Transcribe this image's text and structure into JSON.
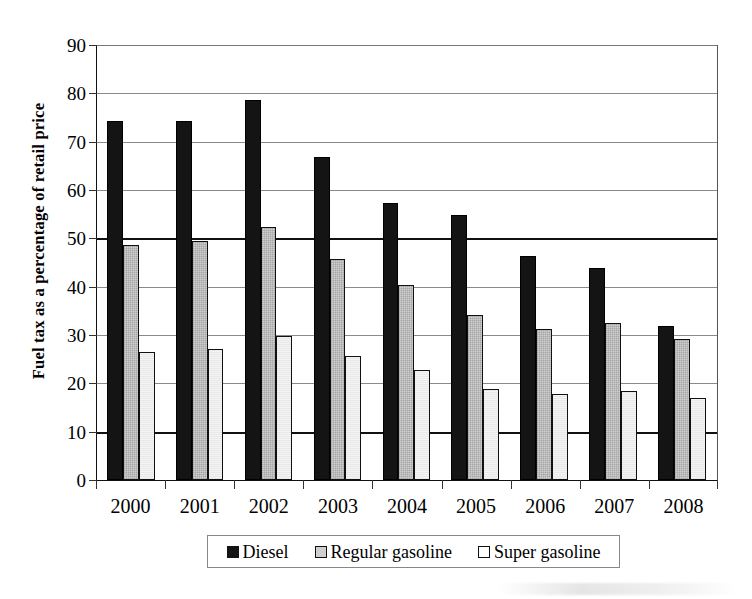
{
  "chart_data": {
    "type": "bar",
    "title": "",
    "xlabel": "",
    "ylabel": "Fuel tax as a percentage of retail price",
    "categories": [
      "2000",
      "2001",
      "2002",
      "2003",
      "2004",
      "2005",
      "2006",
      "2007",
      "2008"
    ],
    "series": [
      {
        "name": "Diesel",
        "color": "#141414",
        "values": [
          74.2,
          74.3,
          78.7,
          66.8,
          57.3,
          54.8,
          46.4,
          43.9,
          31.8
        ]
      },
      {
        "name": "Regular gasoline",
        "color": "#cfcfcf",
        "values": [
          48.7,
          49.4,
          52.4,
          45.7,
          40.4,
          34.2,
          31.3,
          32.5,
          29.2
        ]
      },
      {
        "name": "Super gasoline",
        "color": "#f4f4f4",
        "values": [
          26.4,
          27.2,
          29.8,
          25.6,
          22.7,
          18.8,
          17.7,
          18.4,
          17.0
        ]
      }
    ],
    "ylim": [
      0,
      90
    ],
    "yticks": [
      0,
      10,
      20,
      30,
      40,
      50,
      60,
      70,
      80,
      90
    ],
    "emphasized_gridlines": [
      10,
      50
    ],
    "grid": true,
    "legend_position": "bottom",
    "legend": [
      "Diesel",
      "Regular gasoline",
      "Super gasoline"
    ]
  },
  "axes": {
    "y_tick_labels": [
      "90",
      "80",
      "70",
      "60",
      "50",
      "40",
      "30",
      "20",
      "10",
      "0"
    ],
    "y_axis_title": "Fuel tax as a percentage of retail price"
  },
  "legend": {
    "items": [
      {
        "label": "Diesel",
        "swatch": "swatch-filled-black"
      },
      {
        "label": "Regular gasoline",
        "swatch": "swatch-filled-gray"
      },
      {
        "label": "Super gasoline",
        "swatch": "swatch-filled-white"
      }
    ]
  }
}
